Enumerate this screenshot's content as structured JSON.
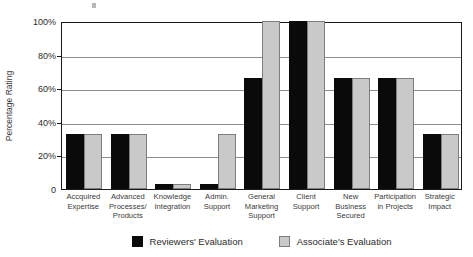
{
  "chart_data": {
    "type": "bar",
    "title": "",
    "xlabel": "",
    "ylabel": "Percentage Rating",
    "ylim": [
      0,
      100
    ],
    "grid": true,
    "legend_position": "bottom",
    "categories": [
      "Accquired Expertise",
      "Advanced Processes/ Products",
      "Knowledge Integration",
      "Admin. Support",
      "General Marketing Support",
      "Client Support",
      "New Business Secured",
      "Participation in Projects",
      "Strategic Impact"
    ],
    "category_lines": [
      [
        "Accquired",
        "Expertise"
      ],
      [
        "Advanced",
        "Processes/",
        "Products"
      ],
      [
        "Knowledge",
        "Integration"
      ],
      [
        "Admin.",
        "Support"
      ],
      [
        "General",
        "Marketing",
        "Support"
      ],
      [
        "Client",
        "Support"
      ],
      [
        "New",
        "Business",
        "Secured"
      ],
      [
        "Participation",
        "in Projects"
      ],
      [
        "Strategic",
        "Impact"
      ]
    ],
    "y_ticks": [
      {
        "value": 100,
        "label": "100%"
      },
      {
        "value": 80,
        "label": "80%"
      },
      {
        "value": 60,
        "label": "60%"
      },
      {
        "value": 40,
        "label": "40%"
      },
      {
        "value": 20,
        "label": "20%"
      },
      {
        "value": 0,
        "label": "0"
      }
    ],
    "series": [
      {
        "name": "Reviewers' Evaluation",
        "color": "#0a0a0a",
        "values": [
          33,
          33,
          3,
          3,
          66,
          100,
          66,
          66,
          33
        ]
      },
      {
        "name": "Associate's Evaluation",
        "color": "#c9c9c9",
        "values": [
          33,
          33,
          3,
          33,
          100,
          100,
          66,
          66,
          33
        ]
      }
    ]
  },
  "legend": {
    "entries": [
      {
        "label": "Reviewers' Evaluation",
        "swatch": "reviewers"
      },
      {
        "label": "Associate's Evaluation",
        "swatch": "associates"
      }
    ]
  },
  "axis": {
    "y_title": "Percentage Rating"
  }
}
